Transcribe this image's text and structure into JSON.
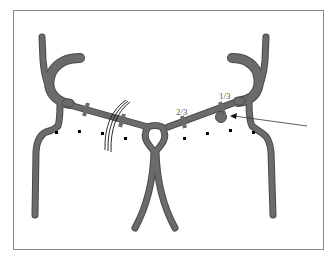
{
  "diagram": {
    "title": "",
    "labels": {
      "two_thirds": "2/3",
      "one_third": "1/3"
    },
    "colors": {
      "vessel": "#6b6b6b",
      "vessel_outline": "#4a4a4a",
      "frame": "#8a8a8a",
      "marker": "#000000",
      "arrow": "#333333",
      "background": "#ffffff"
    },
    "elements": {
      "left_vertebral_branch": "vessel",
      "right_vertebral_branch": "vessel",
      "central_ring": "vessel",
      "lesion_bulge": "aneurysm",
      "sutures": "triple-line",
      "dotted_markers_count": 8,
      "clamp_marks_left": 2,
      "clamp_marks_right": 2
    }
  }
}
